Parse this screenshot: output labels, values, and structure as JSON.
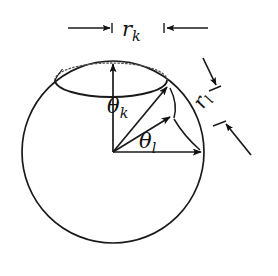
{
  "figure": {
    "type": "geometry-diagram",
    "background_color": "#ffffff",
    "stroke_color": "#1a1a1a",
    "labels": {
      "radius_k": {
        "symbol": "r",
        "subscript": "k",
        "text": "r"
      },
      "radius_l": {
        "symbol": "r",
        "subscript": "l",
        "text": "r"
      },
      "angle_k": {
        "symbol": "θ",
        "subscript": "k",
        "text": "θ"
      },
      "angle_l": {
        "symbol": "θ",
        "subscript": "l",
        "text": "θ"
      }
    },
    "geometry": {
      "sphere": {
        "cx": 113,
        "cy": 152,
        "r": 91
      },
      "cap_ellipse": {
        "cx": 111,
        "cy": 80,
        "rx": 56,
        "ry": 17
      },
      "center_point": {
        "x": 113,
        "y": 152
      },
      "vectors": [
        {
          "name": "polar-axis-vector",
          "to_x": 113,
          "to_y": 62
        },
        {
          "name": "cap-edge-vector-k",
          "to_x": 168,
          "to_y": 85
        },
        {
          "name": "mid-vector",
          "to_x": 172,
          "to_y": 116
        },
        {
          "name": "equator-vector-l",
          "to_x": 203,
          "to_y": 152
        }
      ],
      "dimension_rk": {
        "y": 28,
        "left_tick_x": 112,
        "right_tick_x": 164
      },
      "dimension_rl": {
        "angle_deg": -58
      }
    }
  }
}
